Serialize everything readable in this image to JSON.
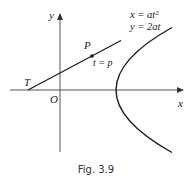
{
  "figure": {
    "caption": "Fig. 3.9",
    "axes": {
      "x_label": "x",
      "y_label": "y",
      "origin_label": "O"
    },
    "curve": {
      "type": "parabola",
      "equation_x": "x = at²",
      "equation_y": "y = 2at"
    },
    "points": {
      "p_label": "P",
      "p_param": "t = p",
      "t_label": "T"
    },
    "colors": {
      "line": "#1a1a1a",
      "axis": "#555555",
      "text": "#222222"
    }
  }
}
